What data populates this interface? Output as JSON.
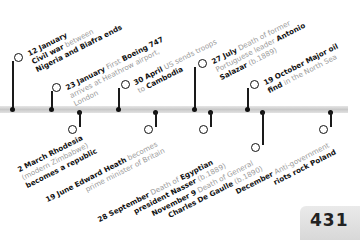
{
  "timeline": {
    "year_events_above": [
      {
        "date": "12 January",
        "text_grey": "Civil war between",
        "text_bold": "Nigeria and Biafra ends",
        "pre_bold": "Civil war",
        "mid_grey": " between"
      },
      {
        "date": "23 January",
        "text_grey": "First",
        "text_bold": "Boeing 747",
        "line2": "arrives at Heathrow airport,",
        "line3": "London"
      },
      {
        "date": "30 April",
        "text_grey": "US sends troops",
        "line2_grey": "to",
        "line2_bold": "Cambodia"
      },
      {
        "date": "27 July",
        "text_grey": "Death of former",
        "line2_grey": "Portuguese leader",
        "line2_bold": "Antonio",
        "line3_bold": "Salazar",
        "line3_grey": "(b.1889)"
      },
      {
        "date": "19 October",
        "text_bold": "Major oil",
        "line2_bold": "find",
        "line2_grey": "in the North Sea"
      }
    ],
    "year_events_below": [
      {
        "date": "2 March",
        "text_bold": "Rhodesia",
        "line2_grey": "(modern Zimbabwe)",
        "line3_bold": "becomes a republic"
      },
      {
        "date": "19 June",
        "text_bold": "Edward Heath",
        "text_grey": "becomes",
        "line2_grey": "prime minister of Britain"
      },
      {
        "date": "28 September",
        "text_grey": "Death of",
        "text_bold": "Egyptian",
        "line2_bold": "president Nasser",
        "line2_grey": "(b.1889)"
      },
      {
        "date": "November 9",
        "text_grey": "Death of General",
        "line2_bold": "Charles De Gaulle",
        "line2_grey": "(b.1890)"
      },
      {
        "date": "December",
        "text_grey": "Anti-government",
        "line2_bold": "riots rock Poland"
      }
    ]
  },
  "page_number": "431"
}
